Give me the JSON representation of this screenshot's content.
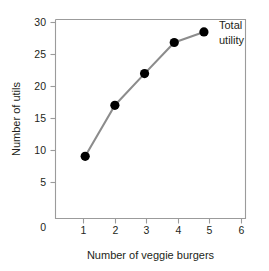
{
  "chart_data": {
    "type": "line",
    "title": "",
    "xlabel": "Number of veggie burgers",
    "ylabel": "Number of utils",
    "xlim": [
      0,
      6.4
    ],
    "ylim": [
      0,
      32
    ],
    "grid": false,
    "legend_position": "inline-right-of-last-point",
    "series": [
      {
        "name": "Total utility",
        "x": [
          1,
          2,
          3,
          4,
          5
        ],
        "values": [
          10,
          18.2,
          23.3,
          28.3,
          30
        ],
        "line_color": "#8c8c8c",
        "marker_color": "#000000"
      }
    ],
    "x_ticks": [
      1,
      2,
      3,
      4,
      5,
      6
    ],
    "x_tick_labels": [
      "1",
      "2",
      "3",
      "4",
      "5",
      "6"
    ],
    "y_ticks": [
      5,
      10,
      15,
      20,
      25,
      30
    ],
    "y_tick_labels": [
      "5",
      "10",
      "15",
      "20",
      "25",
      "30"
    ],
    "origin_label": "0",
    "annotations": [
      {
        "name": "total-utility-label",
        "line1": "Total",
        "line2": "utility"
      }
    ]
  },
  "axes": {
    "x_title": "Number of veggie burgers",
    "y_title": "Number of utils"
  },
  "colors": {
    "line": "#8c8c8c",
    "marker": "#000000",
    "frame": "#9b9b9b",
    "text": "#231f20",
    "background": "#ffffff"
  }
}
